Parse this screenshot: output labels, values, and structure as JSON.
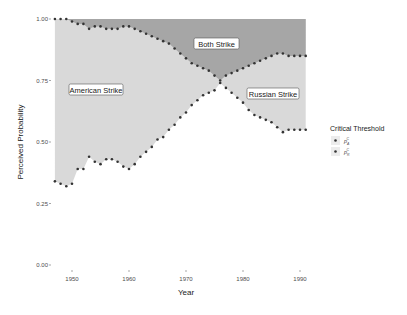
{
  "chart_data": {
    "type": "area",
    "title": "",
    "xlabel": "Year",
    "ylabel": "Perceived Probability",
    "xlim": [
      1947,
      1991
    ],
    "ylim": [
      0,
      1
    ],
    "x_ticks": [
      1950,
      1960,
      1970,
      1980,
      1990
    ],
    "x_tick_labels": [
      "1950",
      "1960",
      "1970",
      "1980",
      "1990"
    ],
    "y_ticks": [
      0,
      0.25,
      0.5,
      0.75,
      1.0
    ],
    "y_tick_labels": [
      "0.00",
      "0.25",
      "0.50",
      "0.75",
      "1.00"
    ],
    "grid": false,
    "legend_position": "right",
    "legend": {
      "title": "Critical Threshold",
      "entries": [
        {
          "label": "p",
          "sub": "A",
          "sup": "C"
        },
        {
          "label": "p",
          "sub": "R",
          "sup": "C"
        }
      ]
    },
    "x": [
      1947,
      1948,
      1949,
      1950,
      1951,
      1952,
      1953,
      1954,
      1955,
      1956,
      1957,
      1958,
      1959,
      1960,
      1961,
      1962,
      1963,
      1964,
      1965,
      1966,
      1967,
      1968,
      1969,
      1970,
      1971,
      1972,
      1973,
      1974,
      1975,
      1976,
      1977,
      1978,
      1979,
      1980,
      1981,
      1982,
      1983,
      1984,
      1985,
      1986,
      1987,
      1988,
      1989,
      1990,
      1991
    ],
    "series": [
      {
        "name": "p_A^C",
        "values": [
          1.0,
          1.0,
          1.0,
          0.99,
          0.98,
          0.98,
          0.96,
          0.97,
          0.97,
          0.96,
          0.96,
          0.96,
          0.97,
          0.97,
          0.96,
          0.95,
          0.94,
          0.93,
          0.92,
          0.91,
          0.9,
          0.88,
          0.86,
          0.84,
          0.82,
          0.81,
          0.8,
          0.79,
          0.77,
          0.75,
          0.72,
          0.7,
          0.68,
          0.66,
          0.63,
          0.61,
          0.6,
          0.59,
          0.58,
          0.56,
          0.54,
          0.55,
          0.55,
          0.55,
          0.55
        ]
      },
      {
        "name": "p_R^C",
        "values": [
          0.34,
          0.33,
          0.32,
          0.33,
          0.39,
          0.39,
          0.44,
          0.42,
          0.41,
          0.43,
          0.43,
          0.42,
          0.4,
          0.39,
          0.41,
          0.44,
          0.46,
          0.48,
          0.51,
          0.52,
          0.55,
          0.57,
          0.6,
          0.62,
          0.65,
          0.67,
          0.69,
          0.7,
          0.71,
          0.74,
          0.77,
          0.78,
          0.79,
          0.8,
          0.81,
          0.82,
          0.83,
          0.84,
          0.85,
          0.86,
          0.86,
          0.85,
          0.85,
          0.85,
          0.85
        ]
      }
    ],
    "regions": [
      {
        "label": "American Strike",
        "fill": "#d9d9d9"
      },
      {
        "label": "Both Strike",
        "fill": "#a6a6a6"
      },
      {
        "label": "Russian Strike",
        "fill": "#d9d9d9"
      }
    ],
    "point_color": "#333333"
  },
  "labels": {
    "american": "American Strike",
    "both": "Both Strike",
    "russian": "Russian Strike",
    "xlabel": "Year",
    "ylabel": "Perceived Probability",
    "legend_title": "Critical Threshold"
  }
}
